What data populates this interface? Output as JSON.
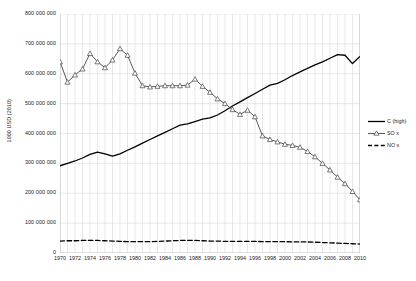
{
  "chart_data": {
    "type": "line",
    "title": "",
    "xlabel": "",
    "ylabel": "1000 USD (2010)",
    "xlim": [
      1970,
      2010
    ],
    "ylim": [
      0,
      800000000
    ],
    "grid": "vertical-yearly-and-horizontal-major",
    "legend_position": "right",
    "y_ticks": [
      0,
      100000000,
      200000000,
      300000000,
      400000000,
      500000000,
      600000000,
      700000000,
      800000000
    ],
    "y_tick_labels": [
      "0",
      "100 000 000",
      "200 000 000",
      "300 000 000",
      "400 000 000",
      "500 000 000",
      "600 000 000",
      "700 000 000",
      "800 000 000"
    ],
    "x_ticks": [
      1970,
      1972,
      1974,
      1976,
      1978,
      1980,
      1982,
      1984,
      1986,
      1988,
      1990,
      1992,
      1994,
      1996,
      1998,
      2000,
      2002,
      2004,
      2006,
      2008,
      2010
    ],
    "x_tick_labels": [
      "1970",
      "1972",
      "1974",
      "1976",
      "1978",
      "1980",
      "1982",
      "1984",
      "1986",
      "1988",
      "1990",
      "1992",
      "1994",
      "1996",
      "1998",
      "2000",
      "2002",
      "2004",
      "2006",
      "2008",
      "2010"
    ],
    "x": [
      1970,
      1971,
      1972,
      1973,
      1974,
      1975,
      1976,
      1977,
      1978,
      1979,
      1980,
      1981,
      1982,
      1983,
      1984,
      1985,
      1986,
      1987,
      1988,
      1989,
      1990,
      1991,
      1992,
      1993,
      1994,
      1995,
      1996,
      1997,
      1998,
      1999,
      2000,
      2001,
      2002,
      2003,
      2004,
      2005,
      2006,
      2007,
      2008,
      2009,
      2010
    ],
    "series": [
      {
        "name": "C (high)",
        "style": "solid",
        "color": "#000000",
        "marker": "none",
        "values": [
          292000000,
          300000000,
          308000000,
          318000000,
          330000000,
          338000000,
          332000000,
          324000000,
          332000000,
          344000000,
          355000000,
          368000000,
          380000000,
          392000000,
          404000000,
          416000000,
          428000000,
          432000000,
          440000000,
          448000000,
          452000000,
          462000000,
          476000000,
          492000000,
          506000000,
          520000000,
          534000000,
          548000000,
          562000000,
          568000000,
          580000000,
          594000000,
          606000000,
          618000000,
          630000000,
          640000000,
          652000000,
          664000000,
          662000000,
          634000000,
          658000000
        ]
      },
      {
        "name": "SO x",
        "style": "solid",
        "color": "#595959",
        "marker": "triangle",
        "values": [
          640000000,
          572000000,
          596000000,
          616000000,
          668000000,
          640000000,
          620000000,
          646000000,
          684000000,
          662000000,
          602000000,
          560000000,
          556000000,
          558000000,
          560000000,
          560000000,
          560000000,
          562000000,
          582000000,
          558000000,
          538000000,
          516000000,
          500000000,
          480000000,
          464000000,
          478000000,
          456000000,
          392000000,
          380000000,
          372000000,
          364000000,
          360000000,
          354000000,
          340000000,
          322000000,
          300000000,
          278000000,
          254000000,
          232000000,
          206000000,
          178000000
        ]
      },
      {
        "name": "NO x",
        "style": "dashed",
        "color": "#000000",
        "marker": "none",
        "values": [
          40000000,
          41000000,
          41000000,
          42000000,
          42000000,
          42000000,
          41000000,
          40000000,
          39000000,
          38000000,
          38000000,
          38000000,
          38000000,
          39000000,
          40000000,
          41000000,
          42000000,
          42000000,
          42000000,
          41000000,
          40000000,
          40000000,
          39000000,
          39000000,
          39000000,
          39000000,
          39000000,
          38000000,
          38000000,
          38000000,
          38000000,
          37000000,
          37000000,
          37000000,
          36000000,
          35000000,
          34000000,
          33000000,
          32000000,
          31000000,
          30000000
        ]
      }
    ]
  },
  "legend": {
    "items": [
      {
        "label": "C (high)",
        "icon": "solid-line-icon"
      },
      {
        "label": "SO x",
        "icon": "triangle-marker-line-icon"
      },
      {
        "label": "NO x",
        "icon": "dashed-line-icon"
      }
    ]
  },
  "colors": {
    "c_high": "#000000",
    "sox": "#595959",
    "nox": "#000000",
    "gridline": "#d9d9d9",
    "axis": "#b0b0b0",
    "background": "#ffffff"
  }
}
